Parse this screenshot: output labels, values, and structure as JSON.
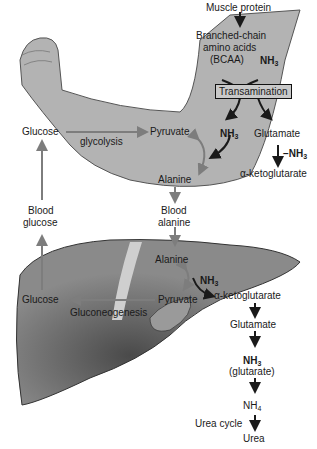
{
  "colors": {
    "arm": "#b3b3b3",
    "arm_outline": "#555555",
    "liver": "#8a8a8a",
    "liver_dark": "#5a5a5a",
    "gall": "#cfcfcf",
    "arrow_gray": "#7d7d7d",
    "arrow_black": "#1a1a1a"
  },
  "muscle": {
    "muscle_protein": "Muscle protein",
    "bcaa_line1": "Branched-chain",
    "bcaa_line2": "amino acids",
    "bcaa_line3": "(BCAA)",
    "nh3_top": "NH",
    "transamination": "Transamination",
    "nh3_mid": "NH",
    "glutamate": "Glutamate",
    "minus_nh3": "−NH",
    "alpha_kg": "α-ketoglutarate",
    "glucose": "Glucose",
    "glycolysis": "glycolysis",
    "pyruvate": "Pyruvate",
    "alanine": "Alanine"
  },
  "blood": {
    "glucose_line1": "Blood",
    "glucose_line2": "glucose",
    "alanine_line1": "Blood",
    "alanine_line2": "alanine"
  },
  "liver": {
    "alanine": "Alanine",
    "nh3": "NH",
    "pyruvate": "Pyruvate",
    "alpha_kg": "α-ketoglutarate",
    "glucose": "Glucose",
    "gluconeogenesis": "Gluconeogenesis",
    "glutamate": "Glutamate",
    "nh3_glut": "NH",
    "glutarate": "(glutarate)",
    "nh4": "NH",
    "urea_cycle": "Urea cycle",
    "urea": "Urea"
  },
  "subscripts": {
    "three": "3",
    "four": "4"
  }
}
